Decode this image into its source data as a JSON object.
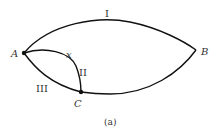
{
  "diagram": {
    "caption": "(a)",
    "nodes": [
      {
        "id": "A",
        "label": "A",
        "x": 24,
        "y": 53
      },
      {
        "id": "B",
        "label": "B",
        "x": 196,
        "y": 50
      },
      {
        "id": "C",
        "label": "C",
        "x": 81,
        "y": 92
      }
    ],
    "edges": [
      {
        "id": "I",
        "label": "I",
        "from": "A",
        "to": "B",
        "route": "upper arc"
      },
      {
        "id": "II",
        "label": "II",
        "from": "A",
        "to": "C",
        "route": "upper inner arc",
        "point_label": "x"
      },
      {
        "id": "III",
        "label": "III",
        "from": "A",
        "to": "C",
        "route": "lower arc"
      },
      {
        "id": "BC",
        "label": "",
        "from": "B",
        "to": "C",
        "route": "lower arc"
      }
    ]
  }
}
